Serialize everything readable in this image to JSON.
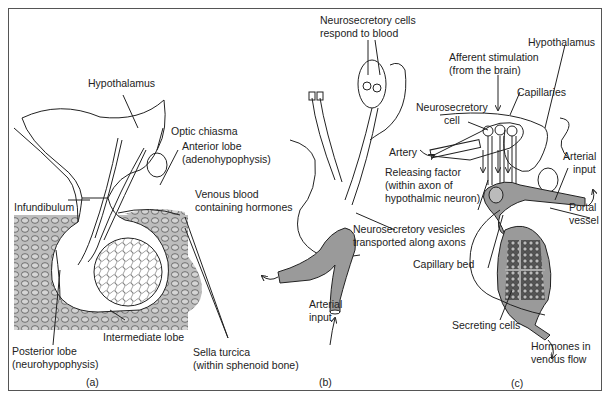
{
  "figure": {
    "panels": [
      {
        "id": "a",
        "caption": "(a)",
        "labels": {
          "hypothalamus": "Hypothalamus",
          "optic_chiasma": "Optic chiasma",
          "anterior_lobe_1": "Anterior lobe",
          "anterior_lobe_2": "(adenohypophysis)",
          "infundibulum": "Infundibulum",
          "intermediate_lobe": "Intermediate lobe",
          "posterior_lobe_1": "Posterior lobe",
          "posterior_lobe_2": "(neurohypophysis)",
          "sella_turcica_1": "Sella turcica",
          "sella_turcica_2": "(within sphenoid bone)"
        }
      },
      {
        "id": "b",
        "caption": "(b)",
        "labels": {
          "neurosecretory_cells_1": "Neurosecretory cells",
          "neurosecretory_cells_2": "respond to blood",
          "venous_blood_1": "Venous blood",
          "venous_blood_2": "containing hormones",
          "vesicles_1": "Neurosecretory vesicles",
          "vesicles_2": "transported along axons",
          "arterial_input_1": "Arterial",
          "arterial_input_2": "input"
        }
      },
      {
        "id": "c",
        "caption": "(c)",
        "labels": {
          "hypothalamus": "Hypothalamus",
          "afferent_1": "Afferent stimulation",
          "afferent_2": "(from the brain)",
          "capillaries": "Capillaries",
          "neurosecretory_cell_1": "Neurosecretory",
          "neurosecretory_cell_2": "cell",
          "artery": "Artery",
          "releasing_factor_1": "Releasing factor",
          "releasing_factor_2": "(within axon of",
          "releasing_factor_3": "hypothalmic neuron)",
          "arterial_input_1": "Arterial",
          "arterial_input_2": "input",
          "portal_vessel_1": "Portal",
          "portal_vessel_2": "vessel",
          "capillary_bed": "Capillary bed",
          "secreting_cells": "Secreting cells",
          "hormones_1": "Hormones in",
          "hormones_2": "venous flow"
        }
      }
    ],
    "colors": {
      "line": "#222222",
      "bone_fill": "#bdbdbd",
      "vessel_fill": "#9a9a9a",
      "frame": "#555555"
    }
  }
}
